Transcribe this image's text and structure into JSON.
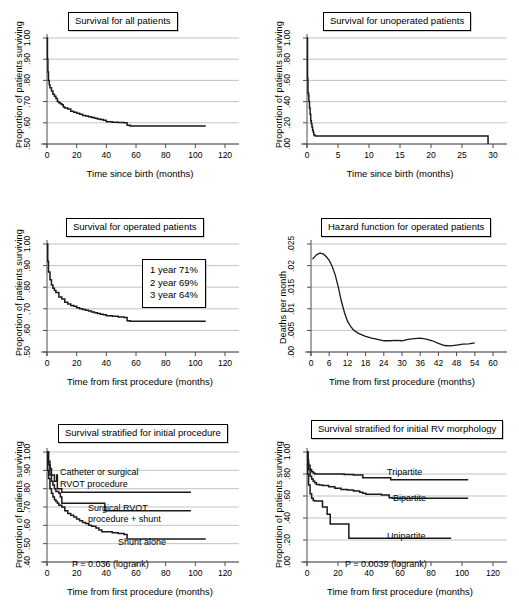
{
  "figure": {
    "background": "#ffffff",
    "line_color": "#1a1a1a",
    "grid_color": "#b4b4b4",
    "axis_color": "#4d4d4d"
  },
  "panels": [
    {
      "id": "survival-all-patients",
      "title": "Survival for all patients",
      "xlabel": "Time since birth (months)",
      "ylabel": "Proportion of patients surviving",
      "xticks": [
        "0",
        "20",
        "40",
        "60",
        "80",
        "100",
        "120"
      ],
      "yticks": [
        ".50",
        ".60",
        ".70",
        ".80",
        ".90",
        "1.00"
      ],
      "annotations": []
    },
    {
      "id": "survival-unoperated-patients",
      "title": "Survival for unoperated patients",
      "xlabel": "Time since birth (months)",
      "ylabel": "Proportion of patients surviving",
      "xticks": [
        "0",
        "5",
        "10",
        "15",
        "20",
        "25",
        "30"
      ],
      "yticks": [
        ".00",
        ".20",
        ".40",
        ".60",
        ".80",
        "1.00"
      ],
      "annotations": []
    },
    {
      "id": "survival-operated-patients",
      "title": "Survival for operated patients",
      "xlabel": "Time from first procedure (months)",
      "ylabel": "Proportion of patients surviving",
      "xticks": [
        "0",
        "20",
        "40",
        "60",
        "80",
        "100",
        "120"
      ],
      "yticks": [
        ".50",
        ".60",
        ".70",
        ".80",
        ".90",
        "1.00"
      ],
      "annotations": [
        "1 year 71%",
        "2 year 69%",
        "3 year 64%"
      ]
    },
    {
      "id": "hazard-operated-patients",
      "title": "Hazard function for operated patients",
      "xlabel": "Time from first procedure (months)",
      "ylabel": "Deaths per month",
      "xticks": [
        "0",
        "6",
        "12",
        "18",
        "24",
        "30",
        "36",
        "42",
        "48",
        "54",
        "60"
      ],
      "yticks": [
        ".00",
        ".005",
        ".01",
        ".015",
        ".02",
        ".025"
      ],
      "annotations": []
    },
    {
      "id": "survival-stratified-initial-procedure",
      "title": "Survival stratified for initial procedure",
      "xlabel": "Time from first procedure (months)",
      "ylabel": "Proportion of patients surviving",
      "xticks": [
        "0",
        "20",
        "40",
        "60",
        "80",
        "100",
        "120"
      ],
      "yticks": [
        ".40",
        ".50",
        ".60",
        ".70",
        ".80",
        ".90",
        "1.00"
      ],
      "annotations": [
        "Catheter or surgical",
        "RVOT procedure",
        "Surgical RVOT",
        "procedure + shunt",
        "Shunt alone",
        "P = 0.036 (logrank)"
      ]
    },
    {
      "id": "survival-stratified-rv-morphology",
      "title": "Survival stratified for initial RV morphology",
      "xlabel": "Time from first procedure (months)",
      "ylabel": "Proportion of patients surviving",
      "xticks": [
        "0",
        "20",
        "40",
        "60",
        "80",
        "100",
        "120"
      ],
      "yticks": [
        ".00",
        ".20",
        ".40",
        ".60",
        ".80",
        "1.00"
      ],
      "annotations": [
        "Tripartite",
        "Bipartite",
        "Unipartite",
        "P = 0.0039 (logrank)"
      ]
    }
  ],
  "chart_data": [
    {
      "type": "line",
      "id": "survival-all-patients",
      "title": "Survival for all patients",
      "xlabel": "Time since birth (months)",
      "ylabel": "Proportion of patients surviving",
      "xlim": [
        0,
        120
      ],
      "ylim": [
        0.5,
        1.0
      ],
      "grid": true,
      "legend": "none",
      "series": [
        {
          "name": "All patients",
          "x": [
            0,
            0.3,
            0.6,
            1,
            1.5,
            2,
            3,
            4,
            5,
            6,
            7,
            8,
            9,
            10,
            11,
            12,
            14,
            16,
            18,
            20,
            22,
            24,
            26,
            28,
            30,
            32,
            34,
            36,
            38,
            40,
            44,
            48,
            52,
            54,
            56,
            60,
            70,
            80,
            90,
            100,
            107
          ],
          "y": [
            1.0,
            0.9,
            0.84,
            0.8,
            0.78,
            0.765,
            0.75,
            0.735,
            0.725,
            0.715,
            0.7,
            0.695,
            0.69,
            0.685,
            0.675,
            0.67,
            0.665,
            0.655,
            0.65,
            0.645,
            0.64,
            0.635,
            0.632,
            0.628,
            0.625,
            0.622,
            0.618,
            0.615,
            0.612,
            0.605,
            0.603,
            0.602,
            0.6,
            0.588,
            0.585,
            0.585,
            0.585,
            0.585,
            0.585,
            0.585,
            0.585
          ]
        }
      ]
    },
    {
      "type": "line",
      "id": "survival-unoperated-patients",
      "title": "Survival for unoperated patients",
      "xlabel": "Time since birth (months)",
      "ylabel": "Proportion of patients surviving",
      "xlim": [
        0,
        30
      ],
      "ylim": [
        0.0,
        1.0
      ],
      "grid": true,
      "legend": "none",
      "series": [
        {
          "name": "Unoperated patients",
          "x": [
            0,
            0.08,
            0.15,
            0.25,
            0.3,
            0.4,
            0.5,
            0.6,
            0.7,
            0.8,
            0.9,
            1.0,
            1.1,
            1.3,
            2,
            5,
            10,
            15,
            20,
            25,
            29,
            29.2
          ],
          "y": [
            1.0,
            0.62,
            0.48,
            0.46,
            0.4,
            0.34,
            0.28,
            0.22,
            0.19,
            0.16,
            0.13,
            0.11,
            0.085,
            0.075,
            0.075,
            0.075,
            0.075,
            0.075,
            0.075,
            0.075,
            0.075,
            0.0
          ]
        }
      ]
    },
    {
      "type": "line",
      "id": "survival-operated-patients",
      "title": "Survival for operated patients",
      "xlabel": "Time from first procedure (months)",
      "ylabel": "Proportion of patients surviving",
      "xlim": [
        0,
        120
      ],
      "ylim": [
        0.5,
        1.0
      ],
      "grid": true,
      "legend": "none",
      "annotation_text": [
        "1 year 71%",
        "2 year 69%",
        "3 year 64%"
      ],
      "series": [
        {
          "name": "Operated patients",
          "x": [
            0,
            0.5,
            1,
            2,
            3,
            4,
            5,
            6,
            8,
            10,
            12,
            14,
            16,
            18,
            20,
            22,
            24,
            26,
            28,
            30,
            32,
            34,
            36,
            38,
            40,
            44,
            48,
            52,
            54,
            56,
            60,
            70,
            80,
            90,
            100,
            107
          ],
          "y": [
            1.0,
            0.92,
            0.87,
            0.835,
            0.81,
            0.795,
            0.785,
            0.775,
            0.755,
            0.745,
            0.73,
            0.722,
            0.715,
            0.712,
            0.705,
            0.7,
            0.697,
            0.693,
            0.69,
            0.685,
            0.682,
            0.678,
            0.675,
            0.672,
            0.668,
            0.665,
            0.662,
            0.66,
            0.645,
            0.642,
            0.642,
            0.642,
            0.642,
            0.642,
            0.642,
            0.642
          ]
        }
      ]
    },
    {
      "type": "line",
      "id": "hazard-operated-patients",
      "title": "Hazard function for operated patients",
      "xlabel": "Time from first procedure (months)",
      "ylabel": "Deaths per month",
      "xlim": [
        0,
        60
      ],
      "ylim": [
        0.0,
        0.025
      ],
      "grid": true,
      "legend": "none",
      "series": [
        {
          "name": "Hazard",
          "x": [
            0.5,
            1,
            2,
            3,
            4,
            5,
            6,
            7,
            8,
            9,
            10,
            11,
            12,
            13,
            14,
            15,
            16,
            18,
            20,
            22,
            24,
            26,
            28,
            30,
            32,
            34,
            36,
            38,
            40,
            42,
            44,
            46,
            48,
            50,
            52,
            54
          ],
          "y": [
            0.0215,
            0.0219,
            0.0226,
            0.0229,
            0.0227,
            0.0221,
            0.0212,
            0.0198,
            0.0178,
            0.015,
            0.0118,
            0.0092,
            0.0072,
            0.006,
            0.0051,
            0.0046,
            0.0042,
            0.0036,
            0.0032,
            0.0029,
            0.0026,
            0.0026,
            0.0027,
            0.0026,
            0.0029,
            0.0031,
            0.0032,
            0.003,
            0.0026,
            0.002,
            0.0015,
            0.0014,
            0.0016,
            0.0018,
            0.0019,
            0.0021
          ]
        }
      ]
    },
    {
      "type": "line",
      "id": "survival-stratified-initial-procedure",
      "title": "Survival stratified for initial procedure",
      "xlabel": "Time from first procedure (months)",
      "ylabel": "Proportion of patients surviving",
      "xlim": [
        0,
        120
      ],
      "ylim": [
        0.4,
        1.0
      ],
      "grid": true,
      "legend": "inline-labels",
      "pvalue": "P = 0.036 (logrank)",
      "series": [
        {
          "name": "Catheter or surgical RVOT procedure",
          "x": [
            0,
            1,
            2,
            3,
            4,
            5,
            6,
            6.5,
            7,
            10,
            12,
            20,
            30,
            38,
            39,
            50,
            60,
            80,
            97
          ],
          "y": [
            1.0,
            0.95,
            0.91,
            0.875,
            0.875,
            0.84,
            0.84,
            0.875,
            0.8,
            0.78,
            0.78,
            0.78,
            0.78,
            0.78,
            0.78,
            0.78,
            0.78,
            0.78,
            0.78
          ]
        },
        {
          "name": "Surgical RVOT procedure + shunt",
          "x": [
            0,
            1,
            2,
            3,
            4,
            5,
            6,
            8,
            9,
            10,
            11,
            20,
            30,
            38,
            39,
            40,
            55,
            70,
            85,
            97
          ],
          "y": [
            1.0,
            0.93,
            0.875,
            0.84,
            0.82,
            0.8,
            0.785,
            0.775,
            0.755,
            0.72,
            0.72,
            0.72,
            0.72,
            0.72,
            0.68,
            0.68,
            0.68,
            0.68,
            0.68,
            0.68
          ]
        },
        {
          "name": "Shunt alone",
          "x": [
            0,
            0.5,
            1,
            2,
            3,
            4,
            5,
            6,
            7,
            8,
            10,
            12,
            14,
            16,
            18,
            20,
            22,
            24,
            26,
            28,
            30,
            33,
            35,
            37,
            40,
            44,
            48,
            52,
            54,
            56,
            60,
            70,
            80,
            90,
            100,
            107
          ],
          "y": [
            1.0,
            0.9,
            0.855,
            0.8,
            0.775,
            0.755,
            0.74,
            0.73,
            0.72,
            0.71,
            0.7,
            0.68,
            0.665,
            0.655,
            0.645,
            0.635,
            0.625,
            0.615,
            0.61,
            0.6,
            0.595,
            0.585,
            0.575,
            0.565,
            0.565,
            0.56,
            0.555,
            0.55,
            0.525,
            0.525,
            0.525,
            0.525,
            0.525,
            0.525,
            0.525,
            0.525
          ]
        }
      ]
    },
    {
      "type": "line",
      "id": "survival-stratified-rv-morphology",
      "title": "Survival stratified for initial RV morphology",
      "xlabel": "Time from first procedure (months)",
      "ylabel": "Proportion of patients surviving",
      "xlim": [
        0,
        120
      ],
      "ylim": [
        0.0,
        1.0
      ],
      "grid": true,
      "legend": "inline-labels",
      "pvalue": "P = 0.0039 (logrank)",
      "series": [
        {
          "name": "Tripartite",
          "x": [
            0,
            0.5,
            1,
            2,
            3,
            4,
            5,
            8,
            12,
            18,
            24,
            30,
            33,
            36,
            40,
            45,
            50,
            53,
            54,
            60,
            70,
            80,
            90,
            100,
            104
          ],
          "y": [
            1.0,
            0.93,
            0.88,
            0.84,
            0.82,
            0.81,
            0.8,
            0.8,
            0.8,
            0.8,
            0.795,
            0.79,
            0.79,
            0.765,
            0.765,
            0.765,
            0.765,
            0.765,
            0.748,
            0.748,
            0.748,
            0.748,
            0.748,
            0.748,
            0.748
          ]
        },
        {
          "name": "Bipartite",
          "x": [
            0,
            0.5,
            1,
            2,
            3,
            4,
            5,
            6,
            8,
            10,
            14,
            18,
            22,
            26,
            30,
            34,
            36,
            38,
            40,
            44,
            48,
            52,
            53,
            55,
            60,
            70,
            80,
            90,
            100,
            104
          ],
          "y": [
            1.0,
            0.9,
            0.84,
            0.78,
            0.755,
            0.735,
            0.72,
            0.705,
            0.7,
            0.695,
            0.685,
            0.67,
            0.66,
            0.655,
            0.645,
            0.635,
            0.625,
            0.615,
            0.615,
            0.615,
            0.61,
            0.61,
            0.585,
            0.58,
            0.58,
            0.58,
            0.58,
            0.58,
            0.58,
            0.58
          ]
        },
        {
          "name": "Unipartite",
          "x": [
            0,
            0.5,
            1,
            2,
            3,
            4,
            5,
            8,
            10,
            12,
            13,
            14,
            15,
            20,
            24,
            26,
            27,
            30,
            40,
            50,
            60,
            70,
            80,
            90,
            93
          ],
          "y": [
            1.0,
            0.8,
            0.7,
            0.62,
            0.58,
            0.56,
            0.555,
            0.555,
            0.5,
            0.5,
            0.435,
            0.435,
            0.345,
            0.345,
            0.345,
            0.345,
            0.215,
            0.215,
            0.215,
            0.215,
            0.215,
            0.215,
            0.215,
            0.215,
            0.215
          ]
        }
      ]
    }
  ]
}
